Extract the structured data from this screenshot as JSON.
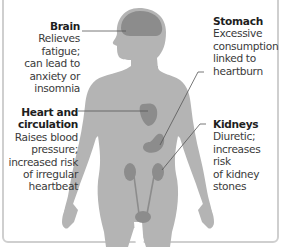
{
  "labels": {
    "brain": {
      "title": "Brain",
      "lines": [
        "Relieves fatigue;",
        "can lead to",
        "anxiety or",
        "insomnia"
      ]
    },
    "heart": {
      "title_lines": [
        "Heart and",
        "circulation"
      ],
      "lines": [
        "Raises blood",
        "pressure;",
        "increased risk",
        "of irregular",
        "heartbeat"
      ]
    },
    "stomach": {
      "title": "Stomach",
      "lines": [
        "Excessive",
        "consumption",
        "linked to",
        "heartburn"
      ]
    },
    "kidneys": {
      "title": "Kidneys",
      "lines": [
        "Diuretic;",
        "increases risk",
        "of kidney",
        "stones"
      ]
    }
  },
  "colors": {
    "body": "#b4b4b4",
    "organ": "#8c8c8c",
    "leader": "#555555",
    "frame": "#cfcfcf"
  }
}
